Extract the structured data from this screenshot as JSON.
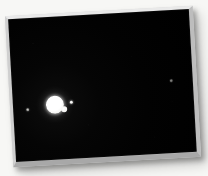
{
  "scene": {
    "title": "Jupiter and Galilean moons",
    "medium": "astrophotograph print",
    "background_color": "#f7f7f5",
    "sky_color": "#000000",
    "frame": {
      "border_color": "#d9d9d9",
      "border_highlight_color": "#e9e9e9",
      "border_shadow_color": "#a8a8a8",
      "rotation_degrees": -3.2,
      "left": 9,
      "top": 11,
      "width": 188,
      "height": 151
    }
  },
  "bodies": [
    {
      "name": "jupiter",
      "label": "Jupiter",
      "class": "planet",
      "x": 33,
      "y": 79,
      "size": 18,
      "brightness": "overexposed-white",
      "color": "#ffffff"
    },
    {
      "name": "transit-notch",
      "label": "moon at limb",
      "class": "transit-notch",
      "x": 48,
      "y": 90,
      "size": 6,
      "brightness": "bright",
      "color": "#f5f5f3"
    },
    {
      "name": "moon-right-inner",
      "label": "moon",
      "class": "moon-bright",
      "x": 57,
      "y": 85,
      "size": 3,
      "brightness": "bright",
      "color": "#ffffff"
    },
    {
      "name": "moon-left-outer",
      "label": "moon",
      "class": "moon-faint",
      "x": 13,
      "y": 90,
      "size": 3,
      "brightness": "faint",
      "color": "#9a9a97"
    },
    {
      "name": "moon-far-right",
      "label": "moon",
      "class": "moon-dim",
      "x": 158,
      "y": 69,
      "size": 3,
      "brightness": "very-faint",
      "color": "#6a6a68"
    }
  ]
}
